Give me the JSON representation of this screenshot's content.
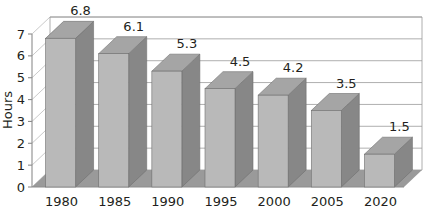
{
  "chart_data": {
    "type": "bar",
    "title": "",
    "subtitle": "",
    "xlabel": "",
    "ylabel": "Hours",
    "categories": [
      "1980",
      "1985",
      "1990",
      "1995",
      "2000",
      "2005",
      "2020"
    ],
    "values": [
      6.8,
      6.1,
      5.3,
      4.5,
      4.2,
      3.5,
      1.5
    ],
    "data_labels": [
      "6.8",
      "6.1",
      "5.3",
      "4.5",
      "4.2",
      "3.5",
      "1.5"
    ],
    "ylim": [
      0,
      7
    ],
    "y_ticks": [
      "0",
      "1",
      "2",
      "3",
      "4",
      "5",
      "6",
      "7"
    ],
    "y_tick_values": [
      0,
      1,
      2,
      3,
      4,
      5,
      6,
      7
    ],
    "grid": true,
    "grid_axis": "y",
    "legend": false,
    "legend_position": "none",
    "three_d": true,
    "series": [
      {
        "name": "Hours",
        "values": [
          6.8,
          6.1,
          5.3,
          4.5,
          4.2,
          3.5,
          1.5
        ]
      }
    ]
  },
  "colors": {
    "bar_front": "#b9b9b9",
    "bar_side": "#878787",
    "bar_top": "#a5a5a5",
    "floor": "#9a9a9a",
    "floor_side": "#8c8c8c",
    "wall": "#ffffff",
    "grid": "#9a9a9a",
    "axis": "#8c8c8c",
    "text": "#231f20",
    "background": "#ffffff"
  }
}
